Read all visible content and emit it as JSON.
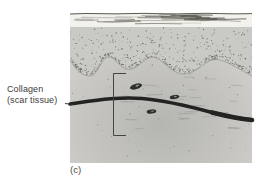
{
  "figure": {
    "caption": "(c)",
    "label": {
      "line1": "Collagen",
      "line2": "(scar tissue)"
    },
    "colors": {
      "background": "#ffffff",
      "keratin_layer": "#f2f1ec",
      "keratin_streak": "#56564f",
      "surface_contour": "#4a4a46",
      "epidermis": "#c9c9c5",
      "stipple": "#60605b",
      "dermis_light": "#d7d6d2",
      "dermis_dark": "#b5b5b1",
      "boundary": "#8a8a82",
      "collagen_band": "#232321",
      "cell_dark": "#2f2f2b",
      "cell_light": "#9a9a92",
      "fiber_line": "#6c6c66",
      "bracket": "#45453f",
      "leader": "#333331",
      "text": "#3b3b38"
    }
  }
}
